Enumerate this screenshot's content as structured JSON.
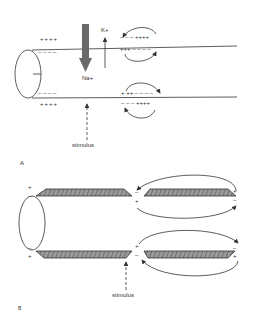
{
  "panel_a": {
    "label": "A",
    "ion_k": "K+",
    "ion_na": "Na+",
    "stimulus": "stimulus",
    "top_membrane": {
      "outer_left": "++++",
      "inner_left": "– – – –",
      "outer_right": "– – – ++++",
      "inner_right": "+++ – – – –"
    },
    "bottom_membrane": {
      "inner_left": "– – – –",
      "outer_left": "++++",
      "inner_right": "+ ++ – – – –",
      "outer_right": "– – – ++++"
    }
  },
  "panel_b": {
    "label": "B",
    "stimulus": "stimulus",
    "node_top_outer": "–",
    "node_top_inner": "+",
    "node_bottom_inner": "+",
    "node_bottom_outer": "–",
    "left_end_top_outer": "+",
    "left_end_top_inner": "–",
    "left_end_bottom_inner": "–",
    "left_end_bottom_outer": "+",
    "right_end_top_outer": "+",
    "right_end_top_inner": "–",
    "right_end_bottom_inner": "–",
    "right_end_bottom_outer": "+"
  },
  "colors": {
    "line": "#333333",
    "myelin_fill": "#888888",
    "na_arrow": "#666666"
  }
}
